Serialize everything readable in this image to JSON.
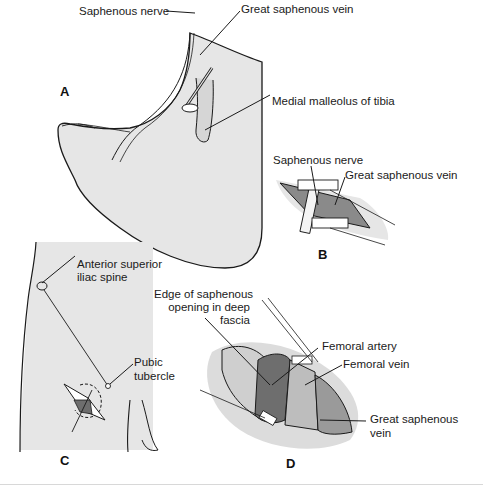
{
  "figure": {
    "panels": {
      "A": {
        "letter": "A",
        "labels": {
          "saphenous_nerve": "Saphenous nerve",
          "great_saphenous_vein": "Great saphenous vein",
          "medial_malleolus": "Medial malleolus of tibia"
        }
      },
      "B": {
        "letter": "B",
        "labels": {
          "saphenous_nerve": "Saphenous nerve",
          "great_saphenous_vein": "Great saphenous vein"
        }
      },
      "C": {
        "letter": "C",
        "labels": {
          "asis_line1": "Anterior superior",
          "asis_line2": "iliac spine",
          "pubic_line1": "Pubic",
          "pubic_line2": "tubercle"
        }
      },
      "D": {
        "letter": "D",
        "labels": {
          "edge_line1": "Edge of saphenous",
          "edge_line2": "opening in deep",
          "edge_line3": "fascia",
          "femoral_artery": "Femoral artery",
          "femoral_vein": "Femoral vein",
          "gsv_line1": "Great saphenous",
          "gsv_line2": "vein"
        }
      }
    },
    "colors": {
      "skin_fill": "#e6e6e6",
      "outline": "#1a1a1a",
      "dark_tissue": "#6e6e6e",
      "mid_tissue": "#a8a8a8"
    }
  }
}
